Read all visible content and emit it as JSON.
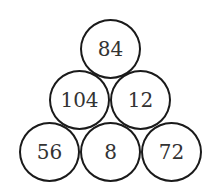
{
  "diagram": {
    "type": "number-pyramid",
    "rows": [
      {
        "values": [
          "84"
        ]
      },
      {
        "values": [
          "104",
          "12"
        ]
      },
      {
        "values": [
          "56",
          "8",
          "72"
        ]
      }
    ]
  },
  "colors": {
    "stroke": "#1a1a1a",
    "text": "#333333",
    "background": "#ffffff"
  }
}
